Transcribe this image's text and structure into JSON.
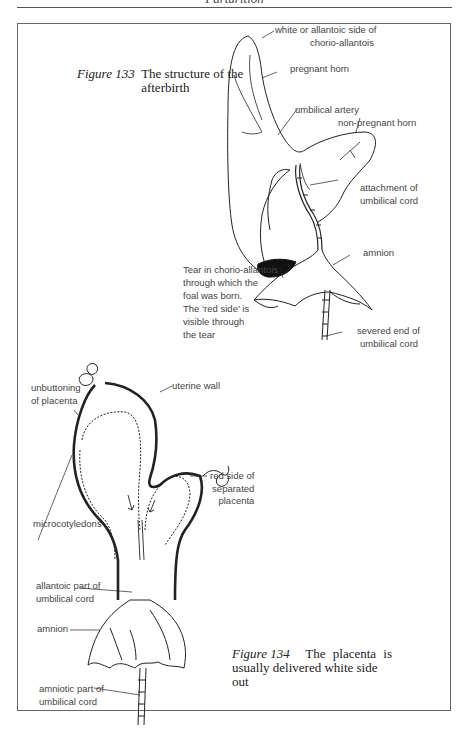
{
  "page": {
    "running_head": "Parturition"
  },
  "figure133": {
    "number": "Figure 133",
    "caption": "The structure of the afterbirth",
    "labels": {
      "white_side": [
        "white or allantoic side of",
        "chorio-allantois"
      ],
      "pregnant_horn": "pregnant horn",
      "umbilical_artery": "umbilical artery",
      "non_pregnant_horn": "non-pregnant horn",
      "attachment": [
        "attachment of",
        "umbilical cord"
      ],
      "amnion": "amnion",
      "tear": [
        "Tear in chorio-allantois",
        "through which the",
        "foal was born.",
        "The ‘red side’ is",
        "visible through",
        "the tear"
      ],
      "severed_end": [
        "severed end of",
        "umbilical cord"
      ]
    }
  },
  "figure134": {
    "number": "Figure 134",
    "caption": "The placenta is usually delivered white side out",
    "caption_lines": [
      "The placenta is",
      "usually delivered white side out"
    ],
    "labels": {
      "unbuttoning": [
        "unbuttoning",
        "of placenta"
      ],
      "uterine_wall": "uterine wall",
      "red_side": [
        "red side of",
        "separated",
        "placenta"
      ],
      "microcotyledons": "microcotyledons",
      "allantoic_part": [
        "allantoic part of",
        "umbilical cord"
      ],
      "amnion": "amnion",
      "amniotic_part": [
        "amniotic part of",
        "umbilical cord"
      ]
    }
  }
}
